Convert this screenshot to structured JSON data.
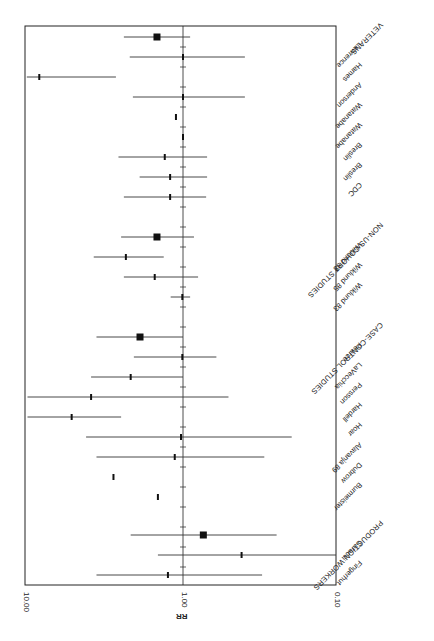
{
  "chart_data": {
    "type": "forest",
    "orientation": "rotated 90 degrees (value axis horizontal, reversed: 10.00 left, 0.10 right)",
    "xlabel": "RR",
    "scale": "log",
    "axis_range": [
      10.0,
      0.1
    ],
    "ticks": [
      "10.00",
      "1.00",
      "0.10"
    ],
    "reference_line": 1.0,
    "groups": [
      {
        "name": "VETERANS",
        "summary": {
          "rr": 1.47,
          "lo": 0.9,
          "hi": 2.4
        },
        "studies": [
          {
            "name": "Lawrence",
            "rr": 1.0,
            "lo": 0.4,
            "hi": 2.2
          },
          {
            "name": "Hames",
            "rr": 8.4,
            "lo": 2.7,
            "hi": 10.1
          },
          {
            "name": "Anderson",
            "rr": 1.0,
            "lo": 0.4,
            "hi": 2.1
          },
          {
            "name": "Watanabe",
            "rr": 1.11,
            "lo": null,
            "hi": null
          },
          {
            "name": "Watanabe",
            "rr": 1.0,
            "lo": null,
            "hi": null
          },
          {
            "name": "Breslin",
            "rr": 1.31,
            "lo": 0.7,
            "hi": 2.6
          },
          {
            "name": "Breslin",
            "rr": 1.21,
            "lo": 0.7,
            "hi": 1.9
          },
          {
            "name": "CDC",
            "rr": 1.21,
            "lo": 0.71,
            "hi": 2.4
          }
        ]
      },
      {
        "name": "NON-US COHORT STUDIES",
        "summary": {
          "rr": 1.47,
          "lo": 0.85,
          "hi": 2.5
        },
        "studies": [
          {
            "name": "Wiklund 88",
            "rr": 2.33,
            "lo": 1.33,
            "hi": 3.75
          },
          {
            "name": "Wiklund 85",
            "rr": 1.52,
            "lo": 0.8,
            "hi": 2.4
          },
          {
            "name": "Wiklund 83",
            "rr": 1.01,
            "lo": 0.9,
            "hi": 1.2
          }
        ]
      },
      {
        "name": "CASE-CONTROL STUDIES",
        "summary": {
          "rr": 1.89,
          "lo": 1.0,
          "hi": 3.6
        },
        "studies": [
          {
            "name": "Pearce",
            "rr": 1.01,
            "lo": 0.61,
            "hi": 2.07
          },
          {
            "name": "LaVecchia",
            "rr": 2.17,
            "lo": 1.0,
            "hi": 3.9
          },
          {
            "name": "Persson",
            "rr": 3.9,
            "lo": 0.51,
            "hi": 10.0
          },
          {
            "name": "Hardell",
            "rr": 5.2,
            "lo": 2.5,
            "hi": 10.0
          },
          {
            "name": "Hoar",
            "rr": 1.03,
            "lo": 0.2,
            "hi": 4.2
          },
          {
            "name": "Alavanja 89",
            "rr": 1.13,
            "lo": 0.3,
            "hi": 3.6
          },
          {
            "name": "Dubrow",
            "rr": 2.8,
            "lo": null,
            "hi": null
          },
          {
            "name": "Burmeister",
            "rr": 1.45,
            "lo": null,
            "hi": null
          }
        ]
      },
      {
        "name": "PRODUCTION WORKERS",
        "summary": {
          "rr": 0.74,
          "lo": 0.25,
          "hi": 2.17
        },
        "studies": [
          {
            "name": "Saracci",
            "rr": 0.42,
            "lo": 0.1,
            "hi": 1.45
          },
          {
            "name": "Fingerhut",
            "rr": 1.25,
            "lo": 0.31,
            "hi": 3.6
          }
        ]
      }
    ],
    "legend": null,
    "grid": false,
    "title": ""
  },
  "rows": [
    {
      "label": "VETERANS",
      "header": true,
      "y": 37,
      "rr": 1.47,
      "lo": 0.9,
      "hi": 2.4
    },
    {
      "label": "Lawrence",
      "y": 57,
      "rr": 1.0,
      "lo": 0.4,
      "hi": 2.2
    },
    {
      "label": "Hames",
      "y": 77,
      "rr": 8.4,
      "lo": 2.7,
      "hi": 10.1
    },
    {
      "label": "Anderson",
      "y": 97,
      "rr": 1.0,
      "lo": 0.4,
      "hi": 2.1
    },
    {
      "label": "Watanabe",
      "y": 117,
      "rr": 1.11
    },
    {
      "label": "Watanabe",
      "y": 137,
      "rr": 1.0
    },
    {
      "label": "Breslin",
      "y": 157,
      "rr": 1.31,
      "lo": 0.7,
      "hi": 2.6
    },
    {
      "label": "Breslin",
      "y": 177,
      "rr": 1.21,
      "lo": 0.7,
      "hi": 1.9
    },
    {
      "label": "CDC",
      "y": 197,
      "rr": 1.21,
      "lo": 0.71,
      "hi": 2.4
    },
    {
      "label": "NON-US COHORT STUDIES",
      "header": true,
      "y": 237,
      "rr": 1.47,
      "lo": 0.85,
      "hi": 2.5
    },
    {
      "label": "Wiklund 88",
      "y": 257,
      "rr": 2.33,
      "lo": 1.33,
      "hi": 3.75
    },
    {
      "label": "Wiklund 85",
      "y": 277,
      "rr": 1.52,
      "lo": 0.8,
      "hi": 2.4
    },
    {
      "label": "Wiklund 83",
      "y": 297,
      "rr": 1.01,
      "lo": 0.9,
      "hi": 1.2
    },
    {
      "label": "CASE-CONTROL STUDIES",
      "header": true,
      "y": 337,
      "rr": 1.89,
      "lo": 1.0,
      "hi": 3.6
    },
    {
      "label": "Pearce",
      "y": 357,
      "rr": 1.01,
      "lo": 0.61,
      "hi": 2.07
    },
    {
      "label": "LaVecchia",
      "y": 377,
      "rr": 2.17,
      "lo": 1.0,
      "hi": 3.9
    },
    {
      "label": "Persson",
      "y": 397,
      "rr": 3.9,
      "lo": 0.51,
      "hi": 10.0
    },
    {
      "label": "Hardell",
      "y": 417,
      "rr": 5.2,
      "lo": 2.5,
      "hi": 10.0
    },
    {
      "label": "Hoar",
      "y": 437,
      "rr": 1.03,
      "lo": 0.2,
      "hi": 4.2
    },
    {
      "label": "Alavanja 89",
      "y": 457,
      "rr": 1.13,
      "lo": 0.3,
      "hi": 3.6
    },
    {
      "label": "Dubrow",
      "y": 477,
      "rr": 2.8
    },
    {
      "label": "Burmeister",
      "y": 497,
      "rr": 1.45
    },
    {
      "label": "PRODUCTION WORKERS",
      "header": true,
      "y": 535,
      "rr": 0.74,
      "lo": 0.25,
      "hi": 2.17
    },
    {
      "label": "Saracci",
      "y": 555,
      "rr": 0.42,
      "lo": 0.1,
      "hi": 1.45
    },
    {
      "label": "Fingerhut",
      "y": 575,
      "rr": 1.25,
      "lo": 0.31,
      "hi": 3.6
    }
  ],
  "axis": {
    "title": "RR",
    "tick_labels": [
      "10.00",
      "1.00",
      "0.10"
    ]
  }
}
